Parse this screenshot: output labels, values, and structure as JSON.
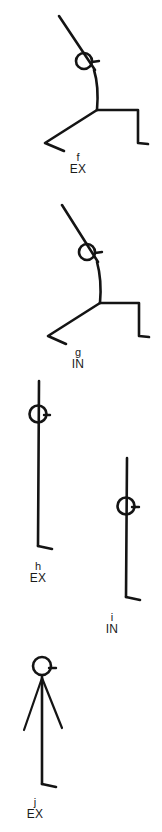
{
  "page": {
    "background_color": "#ffffff",
    "ink_color": "#141414",
    "width": 162,
    "height": 832
  },
  "figures": [
    {
      "id": "figure-f",
      "letter": "f",
      "breath": "EX",
      "pose": "lunging figure leaning forward, diagonal arm through head, right leg stepped back with foot, left leg bent at knee",
      "caption_left": 78,
      "caption_top": 152
    },
    {
      "id": "figure-g",
      "letter": "g",
      "breath": "IN",
      "pose": "lunging figure leaning forward, diagonal arm through head, right leg stepped back with foot, left leg bent at knee",
      "caption_left": 78,
      "caption_top": 347
    },
    {
      "id": "figure-h",
      "letter": "h",
      "breath": "EX",
      "pose": "upright vertical figure, arm line through head, single foot at base",
      "caption_left": 37,
      "caption_top": 561
    },
    {
      "id": "figure-i",
      "letter": "i",
      "breath": "IN",
      "pose": "upright vertical figure, arm line through head, single foot at base",
      "caption_left": 111,
      "caption_top": 612
    },
    {
      "id": "figure-j",
      "letter": "j",
      "breath": "EX",
      "pose": "standing figure with both arms spread downward in a V, vertical body, single foot at base",
      "caption_left": 34,
      "caption_top": 797
    }
  ]
}
